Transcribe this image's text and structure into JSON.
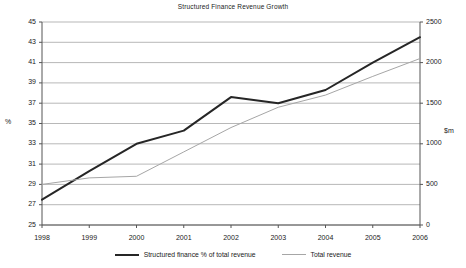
{
  "chart_data": {
    "type": "line",
    "title": "Structured Finance Revenue Growth",
    "xlabel": "",
    "ylabel": "%",
    "ylabel_right": "$m",
    "categories": [
      "1998",
      "1999",
      "2000",
      "2001",
      "2002",
      "2003",
      "2004",
      "2005",
      "2006"
    ],
    "x": [
      1998,
      1999,
      2000,
      2001,
      2002,
      2003,
      2004,
      2005,
      2006
    ],
    "ylim": [
      25,
      45
    ],
    "ylim_right": [
      0,
      2500
    ],
    "yticks": [
      "45",
      "43",
      "41",
      "39",
      "37",
      "35",
      "33",
      "31",
      "29",
      "27",
      "25"
    ],
    "yticks_right": [
      "2500",
      "2000",
      "1500",
      "1000",
      "500",
      "0"
    ],
    "grid": true,
    "legend_position": "bottom",
    "series": [
      {
        "name": "Structured finance % of total revenue",
        "axis": "left",
        "color": "#262626",
        "width": 2,
        "values": [
          27.5,
          30.3,
          33.0,
          34.3,
          37.6,
          37.0,
          38.3,
          41.0,
          43.5
        ]
      },
      {
        "name": "Total revenue",
        "axis": "right",
        "color": "#a6a6a6",
        "width": 1,
        "values": [
          500,
          580,
          600,
          900,
          1200,
          1450,
          1600,
          1830,
          2050
        ]
      }
    ]
  },
  "legend": {
    "entries": [
      {
        "label": "Structured finance % of total revenue"
      },
      {
        "label": "Total revenue"
      }
    ]
  },
  "colors": {
    "primary_series": "#262626",
    "secondary_series": "#a6a6a6",
    "gridline": "#999999",
    "axis": "#555555",
    "background": "#ffffff"
  }
}
